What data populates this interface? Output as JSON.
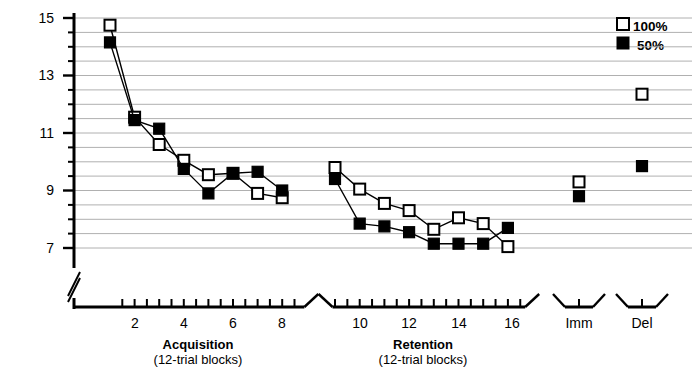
{
  "chart_data": {
    "type": "line",
    "title": "",
    "xlabel": "",
    "ylabel": "RMS Error Score (Deg)",
    "ylim": [
      6.5,
      15.2
    ],
    "yticks": [
      7,
      9,
      11,
      13,
      15
    ],
    "ytick_labels": [
      "7",
      "9",
      "11",
      "13",
      "15"
    ],
    "grid": true,
    "grid_minor_step": 0.5,
    "y_axis_break": true,
    "legend_position": "top-right",
    "panels": [
      {
        "name": "Acquisition",
        "axis_title": "Acquisition",
        "axis_subtitle": "(12-trial blocks)",
        "x": [
          1,
          2,
          3,
          4,
          5,
          6,
          7,
          8
        ],
        "xtick_labels": [
          "2",
          "4",
          "6",
          "8"
        ],
        "xticks_labeled": [
          2,
          4,
          6,
          8
        ]
      },
      {
        "name": "Retention",
        "axis_title": "Retention",
        "axis_subtitle": "(12-trial blocks)",
        "x": [
          9,
          10,
          11,
          12,
          13,
          14,
          15,
          16
        ],
        "xtick_labels": [
          "10",
          "12",
          "14",
          "16"
        ],
        "xticks_labeled": [
          10,
          12,
          14,
          16
        ]
      },
      {
        "name": "Imm",
        "axis_title": "",
        "axis_subtitle": "",
        "xtick_labels": [
          "Imm"
        ]
      },
      {
        "name": "Del",
        "axis_title": "",
        "axis_subtitle": "",
        "xtick_labels": [
          "Del"
        ]
      }
    ],
    "series": [
      {
        "name": "100%",
        "marker": "open-square",
        "color": "#000000",
        "fill": "#ffffff",
        "acquisition": [
          14.75,
          11.55,
          10.6,
          10.05,
          9.55,
          9.6,
          8.9,
          8.75
        ],
        "retention": [
          9.8,
          9.05,
          8.55,
          8.3,
          7.65,
          8.05,
          7.85,
          7.05
        ],
        "imm": 9.3,
        "del": 12.35
      },
      {
        "name": "50%",
        "marker": "filled-square",
        "color": "#000000",
        "fill": "#000000",
        "acquisition": [
          14.15,
          11.45,
          11.15,
          9.75,
          8.9,
          9.6,
          9.65,
          9.0
        ],
        "retention": [
          9.4,
          7.85,
          7.75,
          7.55,
          7.15,
          7.15,
          7.15,
          7.7
        ],
        "imm": 8.8,
        "del": 9.85
      }
    ],
    "legend": [
      {
        "label": "100%",
        "marker": "open-square"
      },
      {
        "label": "50%",
        "marker": "filled-square"
      }
    ]
  },
  "axis": {
    "y_title": "RMS Error Score (Deg)",
    "ytick_labels": [
      "15",
      "13",
      "11",
      "9",
      "7"
    ],
    "acquisition_title": "Acquisition",
    "acquisition_subtitle": "(12-trial blocks)",
    "retention_title": "Retention",
    "retention_subtitle": "(12-trial blocks)",
    "acq_tick_2": "2",
    "acq_tick_4": "4",
    "acq_tick_6": "6",
    "acq_tick_8": "8",
    "ret_tick_10": "10",
    "ret_tick_12": "12",
    "ret_tick_14": "14",
    "ret_tick_16": "16",
    "imm_label": "Imm",
    "del_label": "Del"
  },
  "legend": {
    "item_100_label": "100%",
    "item_50_label": "50%"
  },
  "style": {
    "line_color": "#000000",
    "grid_color": "#b0b0b0",
    "background": "#ffffff"
  }
}
